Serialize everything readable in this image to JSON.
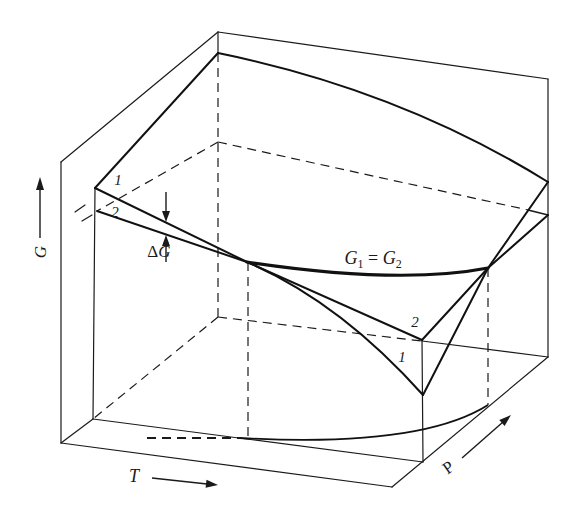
{
  "axes": {
    "g_label": "G",
    "t_label": "T",
    "p_label": "P"
  },
  "surface_labels": {
    "left_surface1": "1",
    "left_surface2": "2",
    "front_surface2": "2",
    "front_surface1": "1"
  },
  "delta_g": {
    "delta": "Δ",
    "symbol": "G"
  },
  "equilibrium": {
    "g1": "G",
    "sub1": "1",
    "equals": " = ",
    "g2": "G",
    "sub2": "2"
  },
  "colors": {
    "line": "#1a1a1a",
    "background": "#ffffff"
  }
}
